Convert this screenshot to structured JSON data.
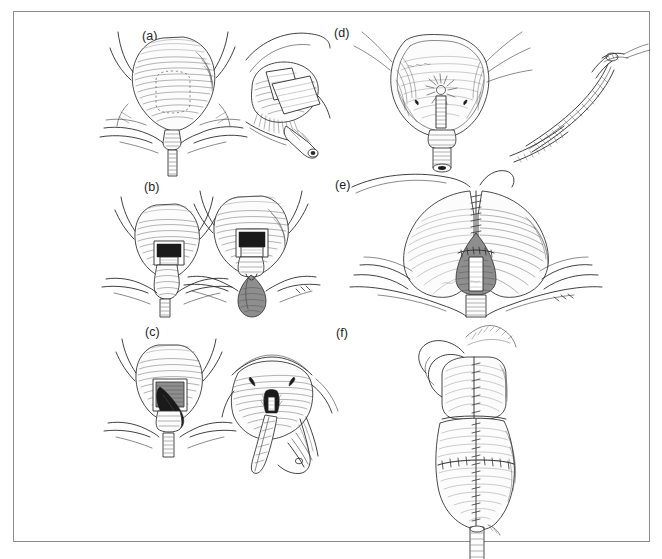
{
  "figure": {
    "medium": "pen-and-ink line art with cross-hatch shading",
    "background_color": "#ffffff",
    "border_color": "#8c8c8c",
    "ink_color": "#2b2b2b",
    "columns": 2,
    "rows": 3,
    "panels": [
      {
        "id": "a",
        "label": "(a)",
        "label_x": 142,
        "label_y": 29,
        "column": "left",
        "row": 1,
        "caption": "Exposed bladder with dotted incision outline, shown beside an oblique view with retractor packs placed and the urethral stump exposed",
        "views": 2,
        "view_names": [
          "anterior-bladder-view",
          "oblique-retracted-view"
        ]
      },
      {
        "id": "b",
        "label": "(b)",
        "label_x": 144,
        "label_y": 180,
        "column": "left",
        "row": 2,
        "caption": "Bladder opened with a rectangular window revealing the dark cavity; adjacent view shows the tissue specimen delivered below the opening",
        "views": 2,
        "view_names": [
          "bladder-window-view",
          "specimen-delivered-view"
        ]
      },
      {
        "id": "c",
        "label": "(c)",
        "label_x": 145,
        "label_y": 325,
        "column": "left",
        "row": 3,
        "caption": "Specimen being withdrawn through the bladder opening; adjacent close-up shows the resected bed with instrument and drain tube in place",
        "views": 2,
        "view_names": [
          "specimen-withdrawal-view",
          "resection-bed-closeup"
        ]
      },
      {
        "id": "d",
        "label": "(d)",
        "label_x": 334,
        "label_y": 26,
        "column": "right",
        "row": 1,
        "caption": "Opened bladder interior showing the trigone, ureteric orifices and the catheterised urethra; inset at right shows a curved instrument with suture threaded",
        "views": 2,
        "view_names": [
          "bladder-interior-view",
          "curved-instrument-inset"
        ]
      },
      {
        "id": "e",
        "label": "(e)",
        "label_x": 335,
        "label_y": 178,
        "column": "right",
        "row": 2,
        "caption": "Interrupted sutures closing the upper bladder wall with the reconstructed neck and catheter emerging below; a faint artist signature appears at lower right",
        "views": 1,
        "view_names": [
          "sutured-closure-view"
        ],
        "has_signature": true
      },
      {
        "id": "f",
        "label": "(f)",
        "label_x": 336,
        "label_y": 326,
        "column": "right",
        "row": 3,
        "caption": "Completed reconstruction showing the bowel segment folded and sutured into a pouch with a continuous midline suture line and the catheter exiting inferiorly",
        "views": 1,
        "view_names": [
          "completed-pouch-view"
        ]
      }
    ]
  }
}
